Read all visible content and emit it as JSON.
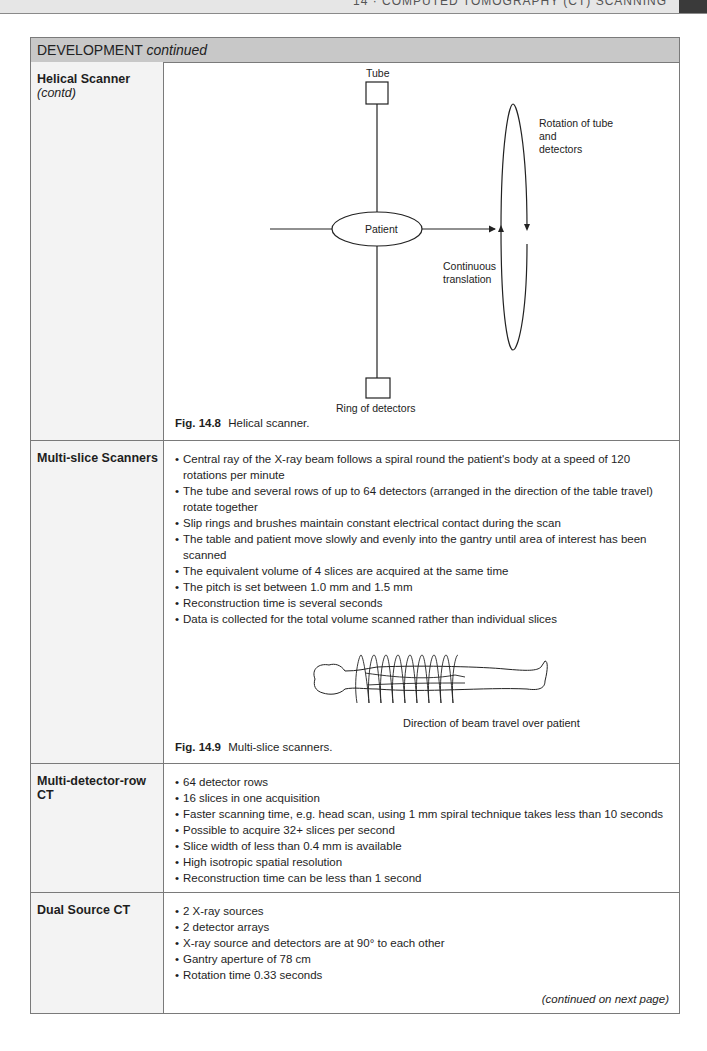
{
  "page_header": {
    "running_title": "14 · COMPUTED TOMOGRAPHY (CT) SCANNING"
  },
  "table": {
    "header": {
      "title": "DEVELOPMENT",
      "title_suffix": "continued"
    },
    "rows": [
      {
        "label": "Helical Scanner",
        "label_suffix": "(contd)",
        "figure": {
          "number": "Fig. 14.8",
          "caption": "Helical scanner.",
          "labels": {
            "tube": "Tube",
            "patient": "Patient",
            "rotation_line1": "Rotation of tube",
            "rotation_line2": "and",
            "rotation_line3": "detectors",
            "translation_line1": "Continuous",
            "translation_line2": "translation",
            "detectors": "Ring of detectors"
          }
        }
      },
      {
        "label": "Multi-slice Scanners",
        "bullets": [
          "Central ray of the X-ray beam follows a spiral round the patient's body at a speed of 120 rotations per minute",
          "The tube and several rows of up to 64 detectors (arranged in the direction of the table travel) rotate together",
          "Slip rings and brushes maintain constant electrical contact during the scan",
          "The table and patient move slowly and evenly into the gantry until area of interest has been scanned",
          "The equivalent volume of 4 slices are acquired at the same time",
          "The pitch is set between 1.0 mm and 1.5 mm",
          "Reconstruction time is several seconds",
          "Data is collected for the total volume scanned rather than individual slices"
        ],
        "figure": {
          "number": "Fig. 14.9",
          "caption": "Multi-slice scanners.",
          "illustration_caption": "Direction of beam travel over patient"
        }
      },
      {
        "label": "Multi-detector-row CT",
        "bullets": [
          "64 detector rows",
          "16 slices in one acquisition",
          "Faster scanning time, e.g. head scan, using 1 mm spiral technique takes less than 10 seconds",
          "Possible to acquire 32+ slices per second",
          "Slice width of less than 0.4 mm is available",
          "High isotropic spatial resolution",
          "Reconstruction time can be less than 1 second"
        ]
      },
      {
        "label": "Dual Source CT",
        "bullets": [
          "2 X-ray sources",
          "2 detector arrays",
          "X-ray source and detectors are at 90° to each other",
          "Gantry aperture of 78 cm",
          "Rotation time 0.33 seconds"
        ],
        "continued_note": "(continued on next page)"
      }
    ]
  }
}
